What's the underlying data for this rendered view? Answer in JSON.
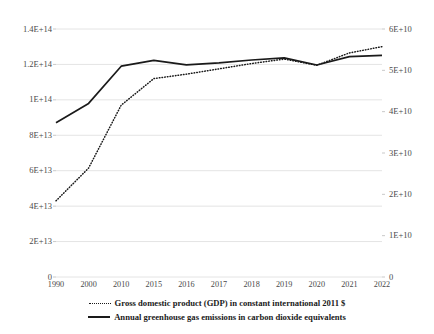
{
  "chart_data": {
    "type": "line",
    "title": "",
    "xlabel": "",
    "categories": [
      "1990",
      "2000",
      "2010",
      "2015",
      "2016",
      "2017",
      "2018",
      "2019",
      "2020",
      "2021",
      "2022"
    ],
    "grid": true,
    "legend_position": "bottom",
    "axes": {
      "left": {
        "label": "",
        "ylim": [
          0,
          140000000000000
        ],
        "tick_values": [
          0,
          20000000000000,
          40000000000000,
          60000000000000,
          80000000000000,
          100000000000000,
          120000000000000,
          140000000000000
        ],
        "tick_labels": [
          "0",
          "2E+13",
          "4E+13",
          "6E+13",
          "8E+13",
          "1E+14",
          "1.2E+14",
          "1.4E+14"
        ]
      },
      "right": {
        "label": "",
        "ylim": [
          0,
          60000000000
        ],
        "tick_values": [
          0,
          10000000000,
          20000000000,
          30000000000,
          40000000000,
          50000000000,
          60000000000
        ],
        "tick_labels": [
          "0",
          "1E+10",
          "2E+10",
          "3E+10",
          "4E+10",
          "5E+10",
          "6E+10"
        ]
      }
    },
    "series": [
      {
        "name": "Gross domestic product (GDP) in constant international 2011 $",
        "axis": "left",
        "style": "dotted",
        "color": "#1a1a1a",
        "values": [
          43000000000000,
          61500000000000,
          97000000000000,
          112000000000000,
          114500000000000,
          117500000000000,
          120500000000000,
          123000000000000,
          119500000000000,
          126500000000000,
          130000000000000
        ]
      },
      {
        "name": "Annual greenhouse gas emissions in carbon dioxide equivalents",
        "axis": "right",
        "style": "solid",
        "color": "#1a1a1a",
        "values": [
          37300000000,
          42000000000,
          51000000000,
          52400000000,
          51300000000,
          51800000000,
          52500000000,
          53000000000,
          51300000000,
          53300000000,
          53600000000
        ]
      }
    ]
  },
  "legend": {
    "items": [
      {
        "label": "Gross domestic product (GDP) in constant international 2011 $",
        "style": "dotted"
      },
      {
        "label": "Annual greenhouse gas emissions in carbon dioxide equivalents",
        "style": "solid"
      }
    ]
  }
}
